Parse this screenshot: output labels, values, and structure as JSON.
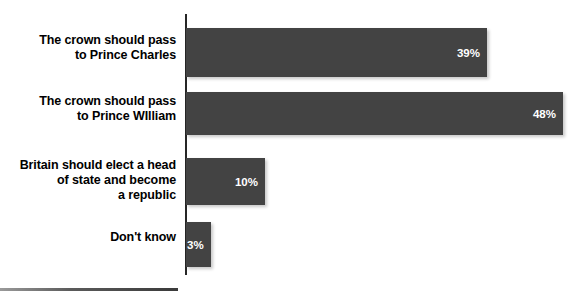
{
  "chart_data": {
    "type": "bar",
    "orientation": "horizontal",
    "title": "",
    "subtitle": "",
    "xlabel": "",
    "ylabel": "",
    "xlim": [
      0,
      48
    ],
    "grid": false,
    "legend": null,
    "value_suffix": "%",
    "categories": [
      "The crown should pass\nto Prince Charles",
      "The crown should pass\nto Prince WIlliam",
      "Britain should elect a head\nof state and become\na republic",
      "Don't know"
    ],
    "values": [
      39,
      48,
      10,
      3
    ],
    "value_labels": [
      "39%",
      "48%",
      "10%",
      "3%"
    ],
    "colors": {
      "bar": "#434343",
      "axis": "#262626",
      "value_text": "#ffffff",
      "category_text": "#000000",
      "background": "#ffffff"
    },
    "rows": [
      {
        "label_lines": [
          "The crown should pass",
          "to Prince Charles"
        ],
        "value": 39,
        "value_label": "39%"
      },
      {
        "label_lines": [
          "The crown should pass",
          "to Prince WIlliam"
        ],
        "value": 48,
        "value_label": "48%"
      },
      {
        "label_lines": [
          "Britain should elect a head",
          "of state and become",
          "a republic"
        ],
        "value": 10,
        "value_label": "10%"
      },
      {
        "label_lines": [
          "Don't know"
        ],
        "value": 3,
        "value_label": "3%"
      }
    ]
  }
}
